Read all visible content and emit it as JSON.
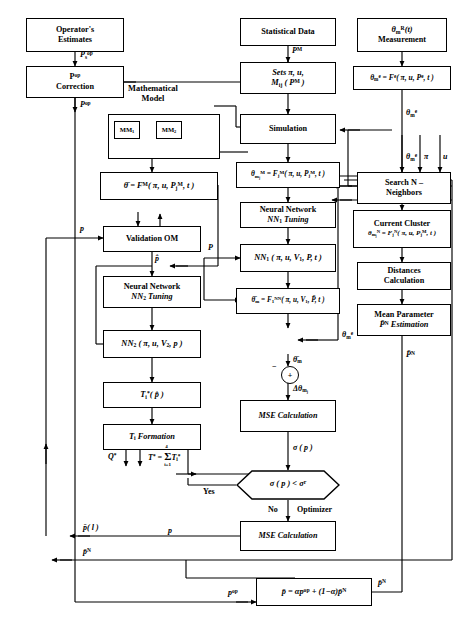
{
  "diagram": {
    "group_titles": {
      "math_model": "Mathematical\nModel",
      "math_model_line1": "Mathematical",
      "math_model_line2": "Model"
    }
  },
  "nodes": {
    "operator_estimates": {
      "line1": "Operator's",
      "line2": "Estimates"
    },
    "pop_correction": {
      "line1": "P<sup>op</sup>",
      "line2": "Correction"
    },
    "statistical_data": {
      "line1": "Statistical Data"
    },
    "sets": {
      "line1": "Sets π, u,",
      "line2": "M<sub>ij</sub> ( P<sup>M</sup> )"
    },
    "simulation": {
      "line1": "Simulation"
    },
    "mm1": {
      "line1": "MM<sub>1</sub>"
    },
    "mm2": {
      "line1": "MM<sub>2</sub>"
    },
    "theta_bar_model": {
      "line1": "θ̄ = F<sup>M</sup>( π, u, P<sub>j</sub><sup>M</sup>, t )"
    },
    "validation_om": {
      "line1": "Validation OM"
    },
    "nn2_tuning": {
      "line1": "Neural Network",
      "line2": "NN<sub>2</sub> Tuning"
    },
    "nn2_block": {
      "line1": "NN<sub>2</sub> ( π, u, V<sub>2</sub>, p )"
    },
    "t_star_i": {
      "line1": "T<sub>i</sub><sup>*</sup>( p̂ )"
    },
    "t_i_formation": {
      "line1": "T<sub>i</sub> Formation"
    },
    "theta_m_model": {
      "line1": "θ<sub>m<sub>j</sub></sub><sup>M</sup> = F<sub>j</sub><sup>M</sup>( π, u, P<sub>j</sub><sup>M</sup>, t )"
    },
    "nn1_tuning": {
      "line1": "Neural Network",
      "line2": "NN<sub>1</sub> Tuning"
    },
    "nn1_block": {
      "line1": "NN<sub>1</sub> ( π, u, V<sub>1</sub>, P, t )"
    },
    "theta_bar_m_nn": {
      "line1": "θ̄<sub>m</sub> = F<sub>1</sub><sup>NN</sup>( π, u, V<sub>1</sub>, P̄, t )"
    },
    "mse_calc_1": {
      "line1": "MSE Calculation"
    },
    "mse_calc_2": {
      "line1": "MSE Calculation"
    },
    "theta_meas": {
      "line1": "θ<sub>m</sub><sup>R</sup>(t)",
      "line2": "Measurement"
    },
    "theta_e": {
      "line1": "θ<sub>m</sub><sup>e</sup> = F<sup>e</sup>( π, u, P<sup>e</sup>, t )"
    },
    "search_neighbors": {
      "line1": "Search N –",
      "line2": "Neighbors"
    },
    "current_cluster": {
      "line1": "Current Cluster",
      "line2": "θ<sub>m<sub>j</sub></sub><sup>N</sup> = F<sub>j</sub><sup>N</sup>( π, u, P<sub>j</sub><sup>M</sup>, t )"
    },
    "distances_calc": {
      "line1": "Distances",
      "line2": "Calculation"
    },
    "mean_param": {
      "line1": "Mean Parameter",
      "line2": "P̄<sup>N</sup> Estimation"
    },
    "final_blend": {
      "line1": "p̄ = αp<sup>op</sup> + (1−α)p̄<sup>N</sup>"
    }
  },
  "decision": {
    "label": "σ ( p ) < σ<sup>r</sup>"
  },
  "summing_junction": {
    "sign_top": "−",
    "sign_body": "+"
  },
  "edge_labels": {
    "p_op_s": "P<sub>s</sub><sup>op</sup>",
    "p_op_1": "P<sup>op</sup>",
    "p_op_2": "P<sup>op</sup>",
    "p_m_top": "P<sup>M</sup>",
    "p_left_valid": "p",
    "p_hat": "p̂",
    "p_nn1": "P",
    "q_star": "Q<sup>*</sup>",
    "t_star_sum": "T<sup>*</sup> = Σ T<sub>i</sub><sup>*</sup>",
    "t_star_sum_upper": "4",
    "t_star_sum_lower": "i=1",
    "theta_bar_m": "θ̄<sub>m</sub>",
    "delta_theta": "Δθ<sub>m<sub>j</sub></sub>",
    "sigma_p": "σ ( p )",
    "yes": "Yes",
    "no": "No",
    "optimizer": "Optimizer",
    "p_bar_l": "p̄( l )",
    "p_bar_n_left": "p̄<sup>N</sup>",
    "p_bar_n_right": "P̄<sup>N</sup>",
    "p_bar_n_bottom": "p̄<sup>N</sup>",
    "p_left_bottom": "p",
    "theta_m_e_1": "θ<sub>m</sub><sup>e</sup>",
    "theta_m_e_2": "θ<sub>m</sub><sup>e</sup>",
    "theta_m_e_3": "θ<sub>m</sub><sup>e</sup>",
    "pi": "π",
    "u": "u",
    "p_op_bottom": "p<sup>op</sup>"
  }
}
